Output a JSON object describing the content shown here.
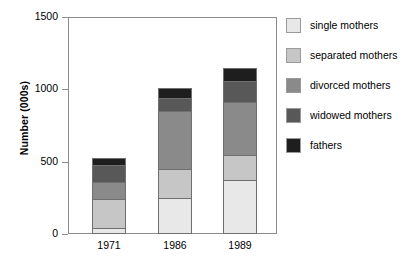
{
  "chart_data": {
    "type": "bar",
    "subtype": "stacked-vertical",
    "title": "",
    "xlabel": "",
    "ylabel": "Number (000s)",
    "categories": [
      "1971",
      "1986",
      "1989"
    ],
    "ylim": [
      0,
      1500
    ],
    "yticks": [
      0,
      500,
      1000,
      1500
    ],
    "ytick_labels": [
      "0",
      "500",
      "1000",
      "1500"
    ],
    "grid": false,
    "legend_position": "right",
    "series": [
      {
        "name": "single mothers",
        "color": "#e8e8e8",
        "values": [
          45,
          250,
          370
        ]
      },
      {
        "name": "separated mothers",
        "color": "#c6c6c6",
        "values": [
          200,
          200,
          175
        ]
      },
      {
        "name": "divorced mothers",
        "color": "#8a8a8a",
        "values": [
          115,
          400,
          370
        ]
      },
      {
        "name": "widowed mothers",
        "color": "#585858",
        "values": [
          120,
          90,
          140
        ]
      },
      {
        "name": "fathers",
        "color": "#1e1e1e",
        "values": [
          45,
          70,
          90
        ]
      }
    ],
    "totals": [
      525,
      1010,
      1145
    ]
  },
  "legend": {
    "items": [
      {
        "label": "single mothers"
      },
      {
        "label": "separated mothers"
      },
      {
        "label": "divorced mothers"
      },
      {
        "label": "widowed mothers"
      },
      {
        "label": "fathers"
      }
    ]
  },
  "axes": {
    "y_title": "Number (000s)",
    "y_tick_labels": [
      "1500",
      "1000",
      "500",
      "0"
    ],
    "x_tick_labels": [
      "1971",
      "1986",
      "1989"
    ]
  },
  "colors": {
    "axis": "#8d8d8d",
    "bar_outline": "#6f6f6f",
    "text": "#000000",
    "background": "#ffffff"
  }
}
